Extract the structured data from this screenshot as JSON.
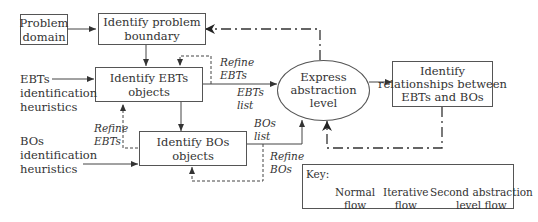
{
  "nodes": {
    "problem_domain": "Problem\ndomain",
    "identify_problem_boundary": "Identify problem\nboundary",
    "identify_ebts": "Identify EBTs\nobjects",
    "identify_bos": "Identify BOs\nobjects",
    "express_abstraction": "Express\nabstraction\nlevel",
    "identify_relationships": "Identify\nrelationships between\nEBTs and BOs"
  },
  "inputs": {
    "ebts_heuristics": "EBTs\nidentification\nheuristics",
    "bos_heuristics": "BOs\nidentification\nheuristics"
  },
  "edge_labels": {
    "refine_ebts_top": "Refine\nEBTs",
    "ebts_list": "EBTs\nlist",
    "refine_ebts_left": "Refine\nEBTs",
    "bos_list": "BOs\nlist",
    "refine_bos": "Refine\nBOs"
  },
  "key": {
    "title": "Key:",
    "normal": "Normal\nflow",
    "iterative": "Iterative\nflow",
    "second": "Second abstraction\nlevel flow"
  }
}
